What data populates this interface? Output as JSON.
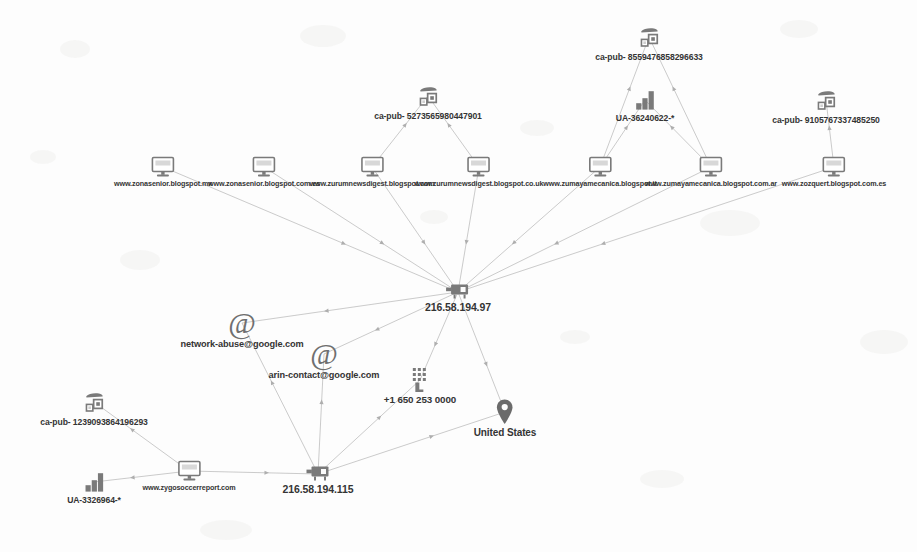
{
  "graph": {
    "title": "link-analysis-graph",
    "background_color": "#fdfdfd",
    "node_color": "#7a7a7a",
    "label_color": "#343434",
    "edge_color": "#b9b9b9",
    "nodes": [
      {
        "id": "w1",
        "type": "website",
        "icon": "monitor-icon",
        "label": "www.zonasenior.blogspot.mx",
        "x": 163,
        "y": 156
      },
      {
        "id": "w2",
        "type": "website",
        "icon": "monitor-icon",
        "label": "www.zonasenior.blogspot.com.es",
        "x": 264,
        "y": 156
      },
      {
        "id": "w3",
        "type": "website",
        "icon": "monitor-icon",
        "label": "www.zurumnewsdigest.blogspot.com",
        "x": 372,
        "y": 156
      },
      {
        "id": "w4",
        "type": "website",
        "icon": "monitor-icon",
        "label": "www.zurumnewsdigest.blogspot.co.uk",
        "x": 479,
        "y": 156
      },
      {
        "id": "w5",
        "type": "website",
        "icon": "monitor-icon",
        "label": "www.zumayamecanica.blogspot.it",
        "x": 600,
        "y": 156
      },
      {
        "id": "w6",
        "type": "website",
        "icon": "monitor-icon",
        "label": "www.zumayamecanica.blogspot.com.ar",
        "x": 711,
        "y": 156
      },
      {
        "id": "w7",
        "type": "website",
        "icon": "monitor-icon",
        "label": "www.zozquert.blogspot.com.es",
        "x": 834,
        "y": 156
      },
      {
        "id": "w8",
        "type": "website",
        "icon": "monitor-icon",
        "label": "www.zygosoccerreport.com",
        "x": 189,
        "y": 460
      },
      {
        "id": "ad1",
        "type": "adsense",
        "icon": "adsense-icon",
        "label": "ca-pub- 5273565980447901",
        "x": 428,
        "y": 84
      },
      {
        "id": "ad2",
        "type": "adsense",
        "icon": "adsense-icon",
        "label": "ca-pub- 8559476858296633",
        "x": 649,
        "y": 25
      },
      {
        "id": "ad3",
        "type": "adsense",
        "icon": "adsense-icon",
        "label": "ca-pub- 9105767337485250",
        "x": 826,
        "y": 88
      },
      {
        "id": "ad4",
        "type": "adsense",
        "icon": "adsense-icon",
        "label": "ca-pub- 1239093864196293",
        "x": 94,
        "y": 390
      },
      {
        "id": "ua1",
        "type": "analytics",
        "icon": "bar-chart-icon",
        "label": "UA-36240622-*",
        "x": 645,
        "y": 88
      },
      {
        "id": "ua2",
        "type": "analytics",
        "icon": "bar-chart-icon",
        "label": "UA-3326964-*",
        "x": 94,
        "y": 470
      },
      {
        "id": "ip1",
        "type": "ip",
        "icon": "server-icon",
        "label": "216.58.194.97",
        "x": 458,
        "y": 280
      },
      {
        "id": "ip2",
        "type": "ip",
        "icon": "server-icon",
        "label": "216.58.194.115",
        "x": 318,
        "y": 462
      },
      {
        "id": "em1",
        "type": "email",
        "icon": "at-icon",
        "label": "network-abuse@google.com",
        "x": 242,
        "y": 308
      },
      {
        "id": "em2",
        "type": "email",
        "icon": "at-icon",
        "label": "arin-contact@google.com",
        "x": 324,
        "y": 339
      },
      {
        "id": "ph1",
        "type": "phone",
        "icon": "keypad-icon",
        "label": "+1 650 253 0000",
        "x": 420,
        "y": 367
      },
      {
        "id": "co1",
        "type": "country",
        "icon": "map-pin-icon",
        "label": "United States",
        "x": 505,
        "y": 398
      }
    ],
    "edges": [
      {
        "from": "w1",
        "to": "ip1"
      },
      {
        "from": "w2",
        "to": "ip1"
      },
      {
        "from": "w3",
        "to": "ip1"
      },
      {
        "from": "w4",
        "to": "ip1"
      },
      {
        "from": "w5",
        "to": "ip1"
      },
      {
        "from": "w6",
        "to": "ip1"
      },
      {
        "from": "w7",
        "to": "ip1"
      },
      {
        "from": "w3",
        "to": "ad1"
      },
      {
        "from": "w4",
        "to": "ad1"
      },
      {
        "from": "w5",
        "to": "ad2"
      },
      {
        "from": "w6",
        "to": "ad2"
      },
      {
        "from": "w5",
        "to": "ua1"
      },
      {
        "from": "w6",
        "to": "ua1"
      },
      {
        "from": "w7",
        "to": "ad3"
      },
      {
        "from": "ip1",
        "to": "em1"
      },
      {
        "from": "ip1",
        "to": "em2"
      },
      {
        "from": "ip1",
        "to": "ph1"
      },
      {
        "from": "ip1",
        "to": "co1"
      },
      {
        "from": "ip2",
        "to": "em1"
      },
      {
        "from": "ip2",
        "to": "em2"
      },
      {
        "from": "ip2",
        "to": "ph1"
      },
      {
        "from": "ip2",
        "to": "co1"
      },
      {
        "from": "w8",
        "to": "ip2"
      },
      {
        "from": "w8",
        "to": "ad4"
      },
      {
        "from": "w8",
        "to": "ua2"
      }
    ]
  }
}
